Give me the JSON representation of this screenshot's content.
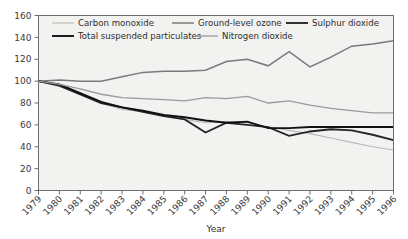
{
  "chart_data": {
    "type": "line",
    "title": "",
    "xlabel": "Year",
    "ylabel": "",
    "xlim": [
      1979,
      1996
    ],
    "ylim": [
      0,
      160
    ],
    "ytick_step": 20,
    "grid": false,
    "legend_position": "top-inside",
    "categories": [
      1979,
      1980,
      1981,
      1982,
      1983,
      1984,
      1985,
      1986,
      1987,
      1988,
      1989,
      1990,
      1991,
      1992,
      1993,
      1994,
      1995,
      1996
    ],
    "ytick_labels": [
      "0",
      "20",
      "40",
      "60",
      "80",
      "100",
      "120",
      "140",
      "160"
    ],
    "ytick_values": [
      0,
      20,
      40,
      60,
      80,
      100,
      120,
      140,
      160
    ],
    "xtick_labels": [
      "1979",
      "1980",
      "1981",
      "1982",
      "1983",
      "1984",
      "1985",
      "1986",
      "1987",
      "1988",
      "1989",
      "1990",
      "1991",
      "1992",
      "1993",
      "1994",
      "1995",
      "1996"
    ],
    "series": [
      {
        "name": "Carbon monoxide",
        "color": "#b9b9b9",
        "width": 1.1,
        "values": [
          100,
          95,
          88,
          80,
          74,
          72,
          69,
          65,
          62,
          63,
          62,
          58,
          55,
          52,
          48,
          44,
          40,
          37
        ]
      },
      {
        "name": "Ground-level ozone",
        "color": "#7a7a7a",
        "width": 1.5,
        "values": [
          100,
          101,
          100,
          100,
          104,
          108,
          109,
          109,
          110,
          118,
          120,
          114,
          127,
          113,
          122,
          132,
          134,
          137
        ]
      },
      {
        "name": "Sulphur dioxide",
        "color": "#262626",
        "width": 1.9,
        "values": [
          100,
          96,
          88,
          80,
          76,
          72,
          68,
          65,
          53,
          62,
          60,
          58,
          50,
          54,
          56,
          55,
          51,
          46
        ]
      },
      {
        "name": "Total suspended particulates",
        "color": "#111111",
        "width": 1.9,
        "values": [
          100,
          97,
          89,
          81,
          76,
          73,
          69,
          67,
          64,
          62,
          63,
          57,
          57,
          58,
          58,
          58,
          58,
          58
        ]
      },
      {
        "name": "Nitrogen dioxide",
        "color": "#9a9a9a",
        "width": 1.3,
        "values": [
          100,
          97,
          93,
          88,
          85,
          84,
          83,
          82,
          85,
          84,
          86,
          80,
          82,
          78,
          75,
          73,
          71,
          71
        ]
      }
    ]
  },
  "legend": {
    "row1": [
      {
        "label": "Carbon monoxide",
        "series": 0
      },
      {
        "label": "Ground-level ozone",
        "series": 1
      },
      {
        "label": "Sulphur dioxide",
        "series": 2
      }
    ],
    "row2": [
      {
        "label": "Total suspended particulates",
        "series": 3
      },
      {
        "label": "Nitrogen dioxide",
        "series": 4
      }
    ]
  },
  "axes": {
    "x_title": "Year"
  },
  "colors": {
    "plot_background": "#f2f2f0",
    "axis": "#6e6e6e",
    "text": "#2e2e2e",
    "page_background": "#ffffff"
  }
}
